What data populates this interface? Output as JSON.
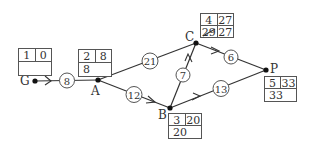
{
  "diagram": {
    "type": "activity-network",
    "nodes": [
      {
        "id": "G",
        "label": "G",
        "order": "1",
        "earliest": "0",
        "latest": ""
      },
      {
        "id": "A",
        "label": "A",
        "order": "2",
        "earliest": "8",
        "latest": "8"
      },
      {
        "id": "B",
        "label": "B",
        "order": "3",
        "earliest": "20",
        "latest": "20"
      },
      {
        "id": "C",
        "label": "C",
        "order": "4",
        "earliest": "27",
        "latest": "29",
        "latest_note": "27"
      },
      {
        "id": "P",
        "label": "P",
        "order": "5",
        "earliest": "33",
        "latest": "33"
      }
    ],
    "edges": [
      {
        "from": "G",
        "to": "A",
        "weight": "8"
      },
      {
        "from": "A",
        "to": "C",
        "weight": "21"
      },
      {
        "from": "A",
        "to": "B",
        "weight": "12"
      },
      {
        "from": "B",
        "to": "C",
        "weight": "7"
      },
      {
        "from": "C",
        "to": "P",
        "weight": "6"
      },
      {
        "from": "B",
        "to": "P",
        "weight": "13"
      }
    ]
  }
}
